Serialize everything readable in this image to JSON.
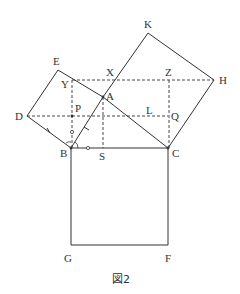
{
  "figure": {
    "caption": "図2",
    "labels": {
      "A": "A",
      "B": "B",
      "C": "C",
      "D": "D",
      "E": "E",
      "F": "F",
      "G": "G",
      "H": "H",
      "K": "K",
      "L": "L",
      "P": "P",
      "Q": "Q",
      "S": "S",
      "X": "X",
      "Y": "Y",
      "Z": "Z"
    },
    "points": {
      "A": [
        103,
        97
      ],
      "B": [
        71,
        148
      ],
      "C": [
        168,
        148
      ],
      "D": [
        27,
        116
      ],
      "E": [
        58,
        70
      ],
      "F": [
        168,
        245
      ],
      "G": [
        71,
        245
      ],
      "H": [
        214,
        80
      ],
      "K": [
        148,
        33
      ],
      "L": [
        150,
        113
      ],
      "P": [
        72,
        116
      ],
      "Q": [
        168,
        116
      ],
      "S": [
        103,
        148
      ],
      "X": [
        113,
        80
      ],
      "Y": [
        72,
        80
      ],
      "Z": [
        169,
        80
      ]
    }
  }
}
